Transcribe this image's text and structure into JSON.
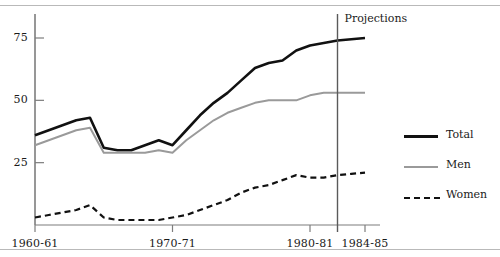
{
  "chart_data": {
    "type": "line",
    "title": "",
    "xlabel": "",
    "ylabel": "",
    "x": [
      "1960-61",
      "1961-62",
      "1962-63",
      "1963-64",
      "1964-65",
      "1965-66",
      "1966-67",
      "1967-68",
      "1968-69",
      "1969-70",
      "1970-71",
      "1971-72",
      "1972-73",
      "1973-74",
      "1974-75",
      "1975-76",
      "1976-77",
      "1977-78",
      "1978-79",
      "1979-80",
      "1980-81",
      "1981-82",
      "1982-83",
      "1983-84",
      "1984-85"
    ],
    "xticks": [
      "1960-61",
      "1970-71",
      "1980-81",
      "1984-85"
    ],
    "xtick_index": [
      0,
      10,
      20,
      24
    ],
    "yticks": [
      25,
      50,
      75
    ],
    "ylim": [
      0,
      88
    ],
    "grid": false,
    "legend_position": "right",
    "series": [
      {
        "name": "Total",
        "style": "solid",
        "color": "#111111",
        "width": 2.6,
        "values": [
          36,
          38,
          40,
          42,
          43,
          31,
          30,
          30,
          32,
          34,
          32,
          38,
          44,
          49,
          53,
          58,
          63,
          65,
          66,
          70,
          72,
          73,
          74,
          74.5,
          75
        ]
      },
      {
        "name": "Men",
        "style": "solid",
        "color": "#9a9a9a",
        "width": 2.0,
        "values": [
          32,
          34,
          36,
          38,
          39,
          29,
          29,
          29,
          29,
          30,
          29,
          34,
          38,
          42,
          45,
          47,
          49,
          50,
          50,
          50,
          52,
          53,
          53,
          53,
          53
        ]
      },
      {
        "name": "Women",
        "style": "dashed",
        "color": "#111111",
        "width": 2.2,
        "values": [
          3,
          4,
          5,
          6,
          8,
          3,
          2,
          2,
          2,
          2,
          3,
          4,
          6,
          8,
          10,
          13,
          15,
          16,
          18,
          20,
          19,
          19,
          20,
          20.5,
          21
        ]
      }
    ],
    "annotations": [
      {
        "name": "projections-divider",
        "label": "Projections",
        "at_x": "1982-83"
      }
    ]
  },
  "legend": {
    "items": [
      {
        "label": "Total"
      },
      {
        "label": "Men"
      },
      {
        "label": "Women"
      }
    ]
  }
}
